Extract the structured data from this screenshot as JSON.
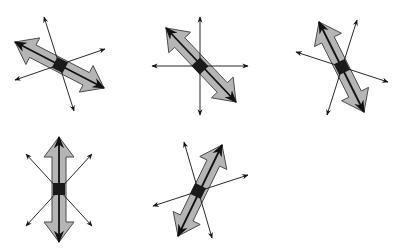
{
  "diagram": {
    "colors": {
      "background": "#ffffff",
      "arrow_fill": "#b5b5b5",
      "arrow_outline": "#4a4a4a",
      "line": "#111111",
      "center_square": "#1a1a1a"
    },
    "figures": [
      {
        "id": "figure-1",
        "center": [
          60,
          65
        ],
        "big_arrow": [
          [
            15,
            42
          ],
          [
            104,
            88
          ]
        ],
        "thin_lines": [
          [
            [
              44,
              17
            ],
            [
              74,
              111
            ]
          ],
          [
            [
              15,
              80
            ],
            [
              105,
              49
            ]
          ]
        ]
      },
      {
        "id": "figure-2",
        "center": [
          200,
          66
        ],
        "big_arrow": [
          [
            166,
            28
          ],
          [
            236,
            102
          ]
        ],
        "thin_lines": [
          [
            [
              200,
              17
            ],
            [
              200,
              115
            ]
          ],
          [
            [
              152,
              66
            ],
            [
              248,
              66
            ]
          ]
        ]
      },
      {
        "id": "figure-3",
        "center": [
          342,
          67
        ],
        "big_arrow": [
          [
            319,
            22
          ],
          [
            364,
            112
          ]
        ],
        "thin_lines": [
          [
            [
              357,
              20
            ],
            [
              327,
              115
            ]
          ],
          [
            [
              296,
              52
            ],
            [
              388,
              82
            ]
          ]
        ]
      },
      {
        "id": "figure-4",
        "center": [
          59,
          189
        ],
        "big_arrow": [
          [
            59,
            137
          ],
          [
            59,
            242
          ]
        ],
        "thin_lines": [
          [
            [
              26,
              154
            ],
            [
              92,
              226
            ]
          ],
          [
            [
              92,
              154
            ],
            [
              26,
              226
            ]
          ]
        ]
      },
      {
        "id": "figure-5",
        "center": [
          198,
          191
        ],
        "big_arrow": [
          [
            222,
            145
          ],
          [
            178,
            236
          ]
        ],
        "thin_lines": [
          [
            [
              184,
              142
            ],
            [
              212,
              238
            ]
          ],
          [
            [
              153,
              206
            ],
            [
              248,
              175
            ]
          ]
        ]
      }
    ]
  }
}
